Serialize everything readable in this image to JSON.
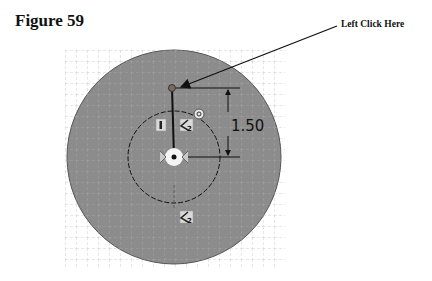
{
  "figure": {
    "title": "Figure 59",
    "callout_label": "Left Click Here"
  },
  "sketch": {
    "dimension_value": "1.50",
    "relation_icons": [
      {
        "name": "vertical-relation-icon",
        "glyph": "I"
      },
      {
        "name": "coincident-relation-icon",
        "glyph": "2"
      },
      {
        "name": "concentric-relation-icon",
        "glyph": "◎"
      },
      {
        "name": "coincident-relation-icon-bottom",
        "glyph": "2"
      }
    ],
    "colors": {
      "outer_fill": "#8c8c8c",
      "grid": "#d8d8d8",
      "line": "#111111",
      "point": "#7a6a60"
    }
  }
}
